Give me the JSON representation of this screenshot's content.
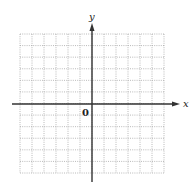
{
  "diagram": {
    "type": "cartesian-grid",
    "axis_labels": {
      "x": "x",
      "y": "y"
    },
    "origin_label": "0",
    "grid": {
      "columns": 12,
      "rows": 12,
      "style": "dotted"
    },
    "colors": {
      "axis": "#333333",
      "grid": "#9a9a9a",
      "background": "#ffffff"
    }
  }
}
